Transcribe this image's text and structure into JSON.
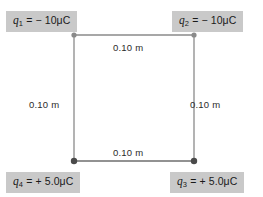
{
  "figure": {
    "colors": {
      "label_background": "#c9c9c9",
      "label_text": "#1a1a1a",
      "square_line": "#8a8a8a",
      "square_line_dark": "#6e6e6e",
      "corner_dot_light": "#8a8a8a",
      "corner_dot_dark": "#4a4a4a",
      "background": "#ffffff",
      "dimension_text": "#2b2b2b"
    }
  },
  "charges": [
    {
      "id": "q1",
      "symbol": "q",
      "subscript": "1",
      "equals": "=",
      "value": "− 10μC",
      "full_text": "q1 = − 10μC",
      "position": "top-left",
      "sign": "negative",
      "magnitude": 10,
      "unit": "μC"
    },
    {
      "id": "q2",
      "symbol": "q",
      "subscript": "2",
      "equals": "=",
      "value": "− 10μC",
      "full_text": "q2 = − 10μC",
      "position": "top-right",
      "sign": "negative",
      "magnitude": 10,
      "unit": "μC"
    },
    {
      "id": "q3",
      "symbol": "q",
      "subscript": "3",
      "equals": "=",
      "value": "+ 5.0μC",
      "full_text": "q3 = + 5.0μC",
      "position": "bottom-right",
      "sign": "positive",
      "magnitude": 5.0,
      "unit": "μC"
    },
    {
      "id": "q4",
      "symbol": "q",
      "subscript": "4",
      "equals": "=",
      "value": "+ 5.0μC",
      "full_text": "q4 = + 5.0μC",
      "position": "bottom-left",
      "sign": "positive",
      "magnitude": 5.0,
      "unit": "μC"
    }
  ],
  "dimensions": {
    "top": "0.10 m",
    "left": "0.10 m",
    "right": "0.10 m",
    "bottom": "0.10 m",
    "side_length": 0.1,
    "unit": "m"
  }
}
